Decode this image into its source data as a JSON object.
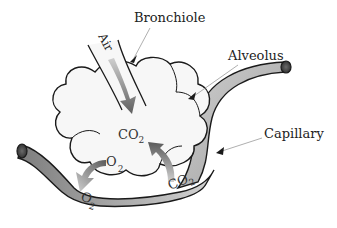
{
  "labels": {
    "bronchiole": "Bronchiole",
    "alveolus": "Alveolus",
    "capillary": "Capillary",
    "air": "Air"
  },
  "gases": {
    "co2_alveolus": {
      "base": "CO",
      "sub": "2"
    },
    "o2_alveolus": {
      "base": "O",
      "sub": "2"
    },
    "o2_capillary": {
      "base": "O",
      "sub": "2"
    },
    "co2_capillary": {
      "base": "CO",
      "sub": "2"
    }
  },
  "colors": {
    "capillary_fill": "#8f8f8f",
    "capillary_light": "#c8c8c8",
    "alveolus_fill": "#f7f7f7",
    "arrow_dark": "#6a6a6a",
    "arrow_light": "#bdbdbd",
    "outline": "#1a1a1a"
  }
}
